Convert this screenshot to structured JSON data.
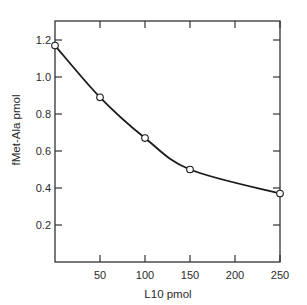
{
  "chart_data": {
    "type": "line",
    "title": "",
    "xlabel": "L10 pmol",
    "ylabel": "fMet-Ala pmol",
    "x": [
      0,
      50,
      100,
      150,
      250
    ],
    "series": [
      {
        "name": "fMet-Ala",
        "values": [
          1.17,
          0.89,
          0.67,
          0.5,
          0.37
        ],
        "marker": "open-circle",
        "curve": "smooth"
      }
    ],
    "xlim": [
      0,
      250
    ],
    "ylim": [
      0,
      1.2
    ],
    "xticks": [
      50,
      100,
      150,
      200,
      250
    ],
    "xtick_labels": [
      "50",
      "100",
      "150",
      "200",
      "250"
    ],
    "yticks": [
      0.2,
      0.4,
      0.6,
      0.8,
      1.0,
      1.2
    ],
    "ytick_labels": [
      "0.2",
      "0.4",
      "0.6",
      "0.8",
      "1.0",
      "1.2"
    ],
    "grid": false,
    "legend": null,
    "frame": "box with ticks on all sides"
  },
  "colors": {
    "line": "#1a1a1a",
    "axis": "#333333",
    "marker_fill": "#ffffff"
  }
}
